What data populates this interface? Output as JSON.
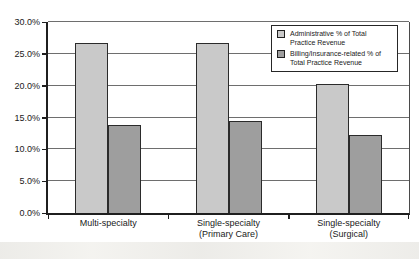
{
  "chart_data": {
    "type": "bar",
    "title": "",
    "categories": [
      "Multi-specialty",
      "Single-specialty (Primary Care)",
      "Single-specialty (Surgical)"
    ],
    "categories_display": [
      "Multi-specialty",
      "Single-specialty\n(Primary Care)",
      "Single-specialty\n(Surgical)"
    ],
    "series": [
      {
        "name": "Administrative % of Total Practice Revenue",
        "label_display": "Administrative % of Total\nPractice Revenue",
        "color": "#c9c9c9",
        "values": [
          26.7,
          26.7,
          20.2
        ]
      },
      {
        "name": "Billing/Insurance-related % of Total Practice Revenue",
        "label_display": "Billing/Insurance-related % of\nTotal Practice Revenue",
        "color": "#9e9e9e",
        "values": [
          13.9,
          14.5,
          12.2
        ]
      }
    ],
    "xlabel": "",
    "ylabel": "",
    "ylim": [
      0,
      30
    ],
    "ytick_step": 5,
    "ytick_labels": [
      "0.0%",
      "5.0%",
      "10.0%",
      "15.0%",
      "20.0%",
      "25.0%",
      "30.0%"
    ],
    "grid": true,
    "legend_position": "top-right",
    "colors": {
      "axis": "#1f1f1f",
      "gridline": "#6e6e6e",
      "bar_border": "#2b2b2b",
      "background": "#ffffff"
    }
  }
}
